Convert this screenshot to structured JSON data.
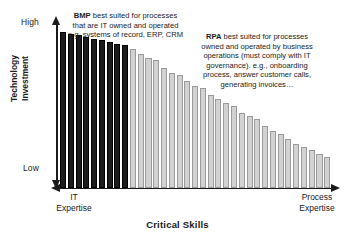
{
  "chart_data": {
    "type": "bar",
    "title": "",
    "xlabel": "Critical Skills",
    "ylabel": "Technology Investment",
    "ylabel_lines": [
      "Technology",
      "Investment"
    ],
    "ytick_labels": [
      "High",
      "Low"
    ],
    "ylim": [
      0,
      100
    ],
    "grid": false,
    "legend_position": "none",
    "x_axis_start_label": "IT Expertise",
    "x_axis_start_label_lines": [
      "IT",
      "Expertise"
    ],
    "x_axis_end_label": "Process Expertise",
    "x_axis_end_label_lines": [
      "Process",
      "Expertise"
    ],
    "categories": [
      "1",
      "2",
      "3",
      "4",
      "5",
      "6",
      "7",
      "8",
      "9",
      "10",
      "11",
      "12",
      "13",
      "14",
      "15",
      "16",
      "17",
      "18",
      "19",
      "20",
      "21",
      "22",
      "23",
      "24",
      "25",
      "26",
      "27",
      "28",
      "29",
      "30",
      "31",
      "32",
      "33",
      "34",
      "35"
    ],
    "values": [
      95,
      94,
      93,
      92,
      91,
      90,
      89,
      88,
      87,
      85,
      82,
      79,
      78,
      73,
      70,
      69,
      65,
      62,
      61,
      57,
      54,
      52,
      50,
      46,
      44,
      42,
      38,
      35,
      33,
      30,
      27,
      25,
      23,
      21,
      19
    ],
    "series": [
      {
        "name": "BMP (IT owned and operated)",
        "color": "#1c1c1c",
        "bar_indices": [
          0,
          1,
          2,
          3,
          4,
          5,
          6,
          7,
          8
        ]
      },
      {
        "name": "RPA (business operations owned)",
        "color": "#d2d2d2",
        "bar_indices": [
          9,
          10,
          11,
          12,
          13,
          14,
          15,
          16,
          17,
          18,
          19,
          20,
          21,
          22,
          23,
          24,
          25,
          26,
          27,
          28,
          29,
          30,
          31,
          32,
          33,
          34
        ]
      }
    ],
    "annotations": [
      {
        "id": "bmp",
        "bold_lead": "BMP",
        "text": " best suited for processes that are IT owned and operated e.g. systems of record, ERP, CRM"
      },
      {
        "id": "rpa",
        "bold_lead": "RPA",
        "text": " best suited for processes owned and operated by business operations (must comply with IT governance). e.g., onboarding process, answer customer calls, generating invoices…"
      }
    ]
  },
  "axis": {
    "y_tick_high": "High",
    "y_tick_low": "Low",
    "y_title_line1": "Technology",
    "y_title_line2": "Investment",
    "x_title": "Critical Skills",
    "x_left_line1": "IT",
    "x_left_line2": "Expertise",
    "x_right_line1": "Process",
    "x_right_line2": "Expertise"
  },
  "colors": {
    "bar_dark": "#1c1c1c",
    "bar_light": "#d2d2d2",
    "bar_light_border": "#9a9a9a",
    "axis": "#1a1a1a",
    "background": "#ffffff",
    "text": "#1a1a1a"
  }
}
